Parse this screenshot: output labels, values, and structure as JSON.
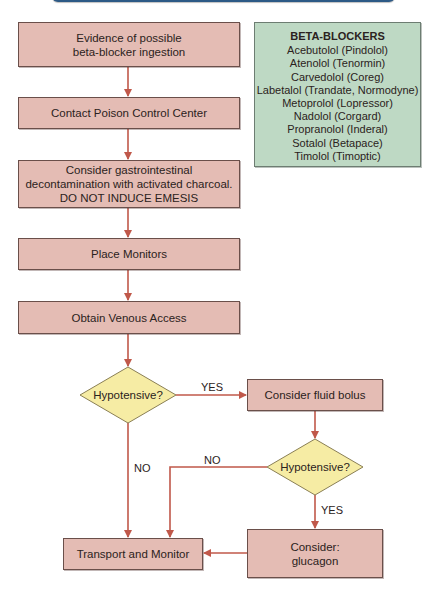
{
  "colors": {
    "process_fill": "#e4bcb4",
    "decision_fill": "#f6eca4",
    "info_fill": "#bed9c4",
    "arrow": "#c0584a",
    "banner": "#2d5a86"
  },
  "flowchart": {
    "steps": [
      {
        "id": "evidence",
        "lines": [
          "Evidence of possible",
          "beta-blocker ingestion"
        ]
      },
      {
        "id": "poison-control",
        "lines": [
          "Contact Poison Control Center"
        ]
      },
      {
        "id": "decontamination",
        "lines": [
          "Consider gastrointestinal",
          "decontamination with activated charcoal.",
          "DO NOT INDUCE EMESIS"
        ]
      },
      {
        "id": "monitors",
        "lines": [
          "Place Monitors"
        ]
      },
      {
        "id": "venous-access",
        "lines": [
          "Obtain Venous Access"
        ]
      },
      {
        "id": "fluid-bolus",
        "lines": [
          "Consider fluid bolus"
        ]
      },
      {
        "id": "glucagon",
        "lines": [
          "Consider:",
          "glucagon"
        ]
      },
      {
        "id": "transport",
        "lines": [
          "Transport and Monitor"
        ]
      }
    ],
    "decisions": [
      {
        "id": "hypotensive-1",
        "label": "Hypotensive?"
      },
      {
        "id": "hypotensive-2",
        "label": "Hypotensive?"
      }
    ],
    "edge_labels": {
      "d1_yes": "YES",
      "d1_no": "NO",
      "d2_no": "NO",
      "d2_yes": "YES"
    }
  },
  "info_box": {
    "title": "BETA-BLOCKERS",
    "items": [
      "Acebutolol (Pindolol)",
      "Atenolol (Tenormin)",
      "Carvedolol (Coreg)",
      "Labetalol (Trandate, Normodyne)",
      "Metoprolol (Lopressor)",
      "Nadolol (Corgard)",
      "Propranolol (Inderal)",
      "Sotalol (Betapace)",
      "Timolol (Timoptic)"
    ]
  }
}
